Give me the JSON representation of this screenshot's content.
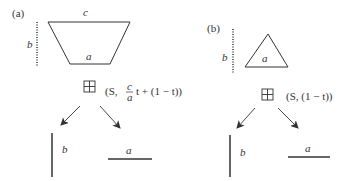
{
  "panels": [
    {
      "label": "(a)",
      "shape": "trapezoid",
      "shape_labels": {
        "top": "c",
        "bottom": "a",
        "height": "b"
      },
      "operator_icon": "grid-icon",
      "formula": {
        "prefix": "(S,",
        "fraction_num": "c",
        "fraction_den": "a",
        "suffix": "t + (1 − t))"
      },
      "result_left_label": "b",
      "result_right_label": "a"
    },
    {
      "label": "(b)",
      "shape": "triangle",
      "shape_labels": {
        "base": "a",
        "height": "b"
      },
      "operator_icon": "grid-icon",
      "formula": {
        "text": "(S, (1 − t))"
      },
      "result_left_label": "b",
      "result_right_label": "a"
    }
  ],
  "colors": {
    "stroke": "#333333",
    "background": "#ffffff"
  }
}
